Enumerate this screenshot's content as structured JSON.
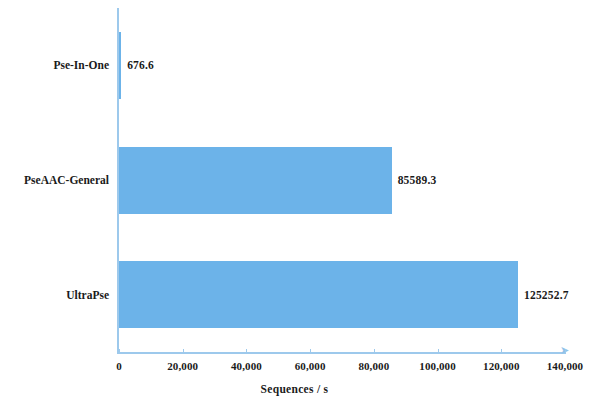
{
  "chart_data": {
    "type": "bar",
    "orientation": "horizontal",
    "title": "",
    "subtitle": "",
    "xlabel": "Sequences / s",
    "ylabel": "",
    "categories": [
      "Pse-In-One",
      "PseAAC-General",
      "UltraPse"
    ],
    "values": [
      676.6,
      85589.3,
      125252.7
    ],
    "value_labels": [
      "676.6",
      "85589.3",
      "125252.7"
    ],
    "xlim": [
      0,
      140000
    ],
    "xticks": [
      0,
      20000,
      40000,
      60000,
      80000,
      100000,
      120000,
      140000
    ],
    "xtick_labels": [
      "0",
      "20,000",
      "40,000",
      "60,000",
      "80,000",
      "100,000",
      "120,000",
      "140,000"
    ],
    "grid": false,
    "legend": null,
    "series": [
      {
        "name": "Sequences / s",
        "values": [
          676.6,
          85589.3,
          125252.7
        ]
      }
    ],
    "colors": {
      "bar": "#6CB3E9",
      "axis": "#9DC9EC",
      "text": "#1a1a1a",
      "background": "#ffffff"
    }
  },
  "axis": {
    "arrow_glyph": "➤"
  }
}
